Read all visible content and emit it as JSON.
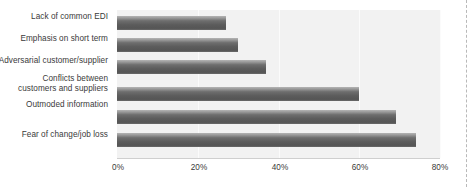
{
  "chart_data": {
    "type": "bar",
    "orientation": "horizontal",
    "title": "",
    "xlabel": "",
    "ylabel": "",
    "categories": [
      "Lack of common EDI",
      "Emphasis on short term",
      "Adversarial customer/supplier",
      "Conflicts between\ncustomers and suppliers",
      "Outmoded information",
      "Fear of change/job loss"
    ],
    "values": [
      27,
      30,
      37,
      60,
      69,
      74
    ],
    "xlim": [
      0,
      80
    ],
    "xticks": [
      0,
      20,
      40,
      60,
      80
    ],
    "xtick_labels": [
      "0%",
      "20%",
      "40%",
      "60%",
      "80%"
    ],
    "grid": true,
    "legend": false,
    "bar_color": "#5c5c5c",
    "plot_background": "#f2f2f2"
  },
  "labels": {
    "items": [
      {
        "line1": "Lack of common EDI",
        "line2": ""
      },
      {
        "line1": "Emphasis on short term",
        "line2": ""
      },
      {
        "line1": "Adversarial customer/supplier",
        "line2": ""
      },
      {
        "line1": "Conflicts between",
        "line2": "customers and suppliers"
      },
      {
        "line1": "Outmoded information",
        "line2": ""
      },
      {
        "line1": "Fear of change/job loss",
        "line2": ""
      }
    ]
  },
  "axis": {
    "ticks": [
      "0%",
      "20%",
      "40%",
      "60%",
      "80%"
    ]
  }
}
